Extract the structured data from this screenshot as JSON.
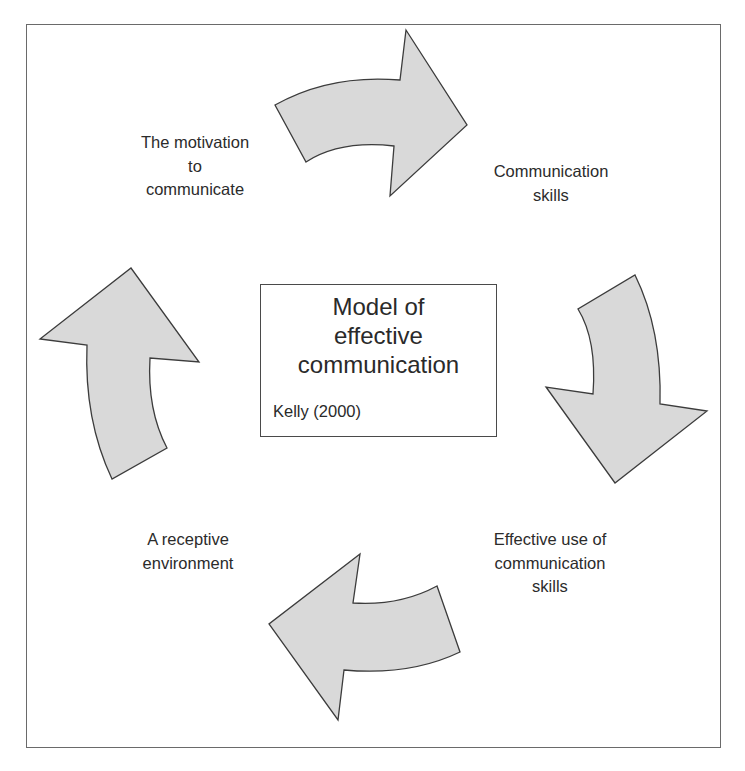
{
  "diagram": {
    "type": "cycle",
    "center": {
      "title_lines": [
        "Model of",
        "effective",
        "communication"
      ],
      "citation": "Kelly (2000)"
    },
    "nodes": [
      {
        "id": "motivation",
        "lines": [
          "The motivation",
          "to",
          "communicate"
        ]
      },
      {
        "id": "skills",
        "lines": [
          "Communication",
          "skills"
        ]
      },
      {
        "id": "effective-use",
        "lines": [
          "Effective use of",
          "communication",
          "skills"
        ]
      },
      {
        "id": "receptive-env",
        "lines": [
          "A receptive",
          "environment"
        ]
      }
    ],
    "edges": [
      {
        "from": "motivation",
        "to": "skills",
        "shape": "curved-arrow-right"
      },
      {
        "from": "skills",
        "to": "effective-use",
        "shape": "curved-arrow-down"
      },
      {
        "from": "effective-use",
        "to": "receptive-env",
        "shape": "curved-arrow-left"
      },
      {
        "from": "receptive-env",
        "to": "motivation",
        "shape": "curved-arrow-up"
      }
    ],
    "colors": {
      "arrow_fill": "#d9d9d9",
      "arrow_stroke": "#3c3c3c",
      "frame": "#6a6a6a",
      "text": "#2b2b2b"
    }
  }
}
